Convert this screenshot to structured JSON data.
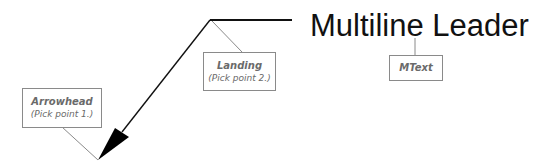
{
  "diagram": {
    "title": "Multiline Leader",
    "labels": {
      "arrowhead": {
        "title": "Arrowhead",
        "subtitle": "(Pick point 1.)"
      },
      "landing": {
        "title": "Landing",
        "subtitle": "(Pick point 2.)"
      },
      "mtext": {
        "title": "MText"
      }
    },
    "colors": {
      "leader": "#111111",
      "callout_line": "#8a8a8a",
      "callout_text": "#6a6a6a"
    }
  }
}
